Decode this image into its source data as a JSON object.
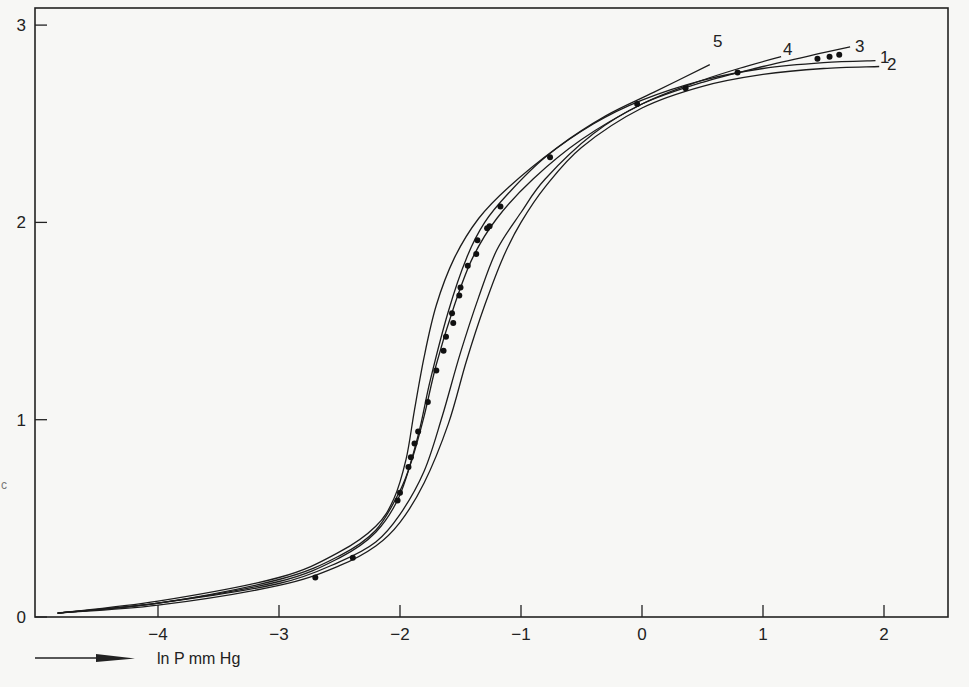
{
  "chart_data": {
    "type": "line",
    "title": "",
    "xlabel": "ln P mm Hg",
    "ylabel": "",
    "xlim": [
      -4.9,
      2.5
    ],
    "ylim": [
      0,
      3.05
    ],
    "x_ticks": [
      -4,
      -3,
      -2,
      -1,
      0,
      1,
      2
    ],
    "x_tick_labels": [
      "-4",
      "-3",
      "-2",
      "-1",
      "0",
      "1",
      "2"
    ],
    "y_ticks": [
      0,
      1,
      2,
      3
    ],
    "y_tick_labels": [
      "0",
      "1",
      "2",
      "3"
    ],
    "grid": false,
    "legend": "inline curve labels at upper-right",
    "series": [
      {
        "name": "1",
        "label": "1",
        "kind": "curve",
        "points": [
          [
            -4.83,
            0.02
          ],
          [
            -4.0,
            0.07
          ],
          [
            -3.0,
            0.18
          ],
          [
            -2.5,
            0.3
          ],
          [
            -2.2,
            0.43
          ],
          [
            -2.0,
            0.62
          ],
          [
            -1.85,
            0.92
          ],
          [
            -1.75,
            1.2
          ],
          [
            -1.6,
            1.55
          ],
          [
            -1.45,
            1.82
          ],
          [
            -1.3,
            2.0
          ],
          [
            -1.1,
            2.15
          ],
          [
            -0.8,
            2.33
          ],
          [
            -0.4,
            2.5
          ],
          [
            0.0,
            2.62
          ],
          [
            0.5,
            2.72
          ],
          [
            1.0,
            2.78
          ],
          [
            1.5,
            2.81
          ],
          [
            1.93,
            2.82
          ]
        ]
      },
      {
        "name": "2",
        "label": "2",
        "kind": "curve",
        "points": [
          [
            -4.83,
            0.02
          ],
          [
            -4.0,
            0.06
          ],
          [
            -3.0,
            0.16
          ],
          [
            -2.5,
            0.26
          ],
          [
            -2.2,
            0.36
          ],
          [
            -2.0,
            0.48
          ],
          [
            -1.8,
            0.68
          ],
          [
            -1.6,
            0.98
          ],
          [
            -1.45,
            1.3
          ],
          [
            -1.3,
            1.58
          ],
          [
            -1.15,
            1.82
          ],
          [
            -1.0,
            2.0
          ],
          [
            -0.8,
            2.18
          ],
          [
            -0.5,
            2.38
          ],
          [
            0.0,
            2.58
          ],
          [
            0.5,
            2.69
          ],
          [
            1.0,
            2.75
          ],
          [
            1.5,
            2.78
          ],
          [
            1.96,
            2.79
          ]
        ]
      },
      {
        "name": "3",
        "label": "3",
        "kind": "curve",
        "points": [
          [
            -4.83,
            0.02
          ],
          [
            -4.0,
            0.07
          ],
          [
            -3.0,
            0.17
          ],
          [
            -2.5,
            0.28
          ],
          [
            -2.2,
            0.38
          ],
          [
            -2.0,
            0.52
          ],
          [
            -1.8,
            0.74
          ],
          [
            -1.65,
            1.02
          ],
          [
            -1.5,
            1.34
          ],
          [
            -1.35,
            1.62
          ],
          [
            -1.2,
            1.86
          ],
          [
            -1.0,
            2.05
          ],
          [
            -0.8,
            2.22
          ],
          [
            -0.4,
            2.45
          ],
          [
            0.0,
            2.6
          ],
          [
            0.5,
            2.71
          ],
          [
            1.0,
            2.79
          ],
          [
            1.5,
            2.86
          ],
          [
            1.72,
            2.89
          ]
        ]
      },
      {
        "name": "4",
        "label": "4",
        "kind": "curve",
        "points": [
          [
            -4.83,
            0.02
          ],
          [
            -4.0,
            0.07
          ],
          [
            -3.0,
            0.19
          ],
          [
            -2.5,
            0.31
          ],
          [
            -2.2,
            0.44
          ],
          [
            -2.0,
            0.64
          ],
          [
            -1.9,
            0.8
          ],
          [
            -1.8,
            1.02
          ],
          [
            -1.7,
            1.28
          ],
          [
            -1.55,
            1.58
          ],
          [
            -1.4,
            1.82
          ],
          [
            -1.2,
            2.02
          ],
          [
            -0.9,
            2.22
          ],
          [
            -0.5,
            2.42
          ],
          [
            0.0,
            2.6
          ],
          [
            0.4,
            2.7
          ],
          [
            0.8,
            2.78
          ],
          [
            1.15,
            2.84
          ]
        ]
      },
      {
        "name": "5",
        "label": "5",
        "kind": "curve",
        "points": [
          [
            -4.83,
            0.02
          ],
          [
            -4.0,
            0.08
          ],
          [
            -3.0,
            0.2
          ],
          [
            -2.5,
            0.33
          ],
          [
            -2.2,
            0.46
          ],
          [
            -2.05,
            0.6
          ],
          [
            -1.95,
            0.8
          ],
          [
            -1.88,
            1.05
          ],
          [
            -1.8,
            1.32
          ],
          [
            -1.7,
            1.58
          ],
          [
            -1.55,
            1.82
          ],
          [
            -1.35,
            2.02
          ],
          [
            -1.1,
            2.18
          ],
          [
            -0.7,
            2.38
          ],
          [
            -0.3,
            2.54
          ],
          [
            0.1,
            2.66
          ],
          [
            0.56,
            2.8
          ]
        ]
      },
      {
        "name": "experimental",
        "label": "",
        "kind": "points",
        "points": [
          [
            -2.7,
            0.2
          ],
          [
            -2.39,
            0.3
          ],
          [
            -2.02,
            0.59
          ],
          [
            -2.0,
            0.63
          ],
          [
            -1.93,
            0.76
          ],
          [
            -1.91,
            0.81
          ],
          [
            -1.88,
            0.88
          ],
          [
            -1.85,
            0.94
          ],
          [
            -1.77,
            1.09
          ],
          [
            -1.7,
            1.25
          ],
          [
            -1.64,
            1.35
          ],
          [
            -1.62,
            1.42
          ],
          [
            -1.56,
            1.49
          ],
          [
            -1.57,
            1.54
          ],
          [
            -1.51,
            1.63
          ],
          [
            -1.5,
            1.67
          ],
          [
            -1.44,
            1.78
          ],
          [
            -1.37,
            1.84
          ],
          [
            -1.36,
            1.91
          ],
          [
            -1.28,
            1.97
          ],
          [
            -1.26,
            1.98
          ],
          [
            -1.17,
            2.08
          ],
          [
            -0.76,
            2.33
          ],
          [
            -0.04,
            2.6
          ],
          [
            0.36,
            2.68
          ],
          [
            0.79,
            2.76
          ],
          [
            1.45,
            2.83
          ],
          [
            1.55,
            2.84
          ],
          [
            1.63,
            2.85
          ]
        ]
      }
    ],
    "curve_label_texts": [
      "5",
      "4",
      "3",
      "1",
      "2"
    ]
  }
}
